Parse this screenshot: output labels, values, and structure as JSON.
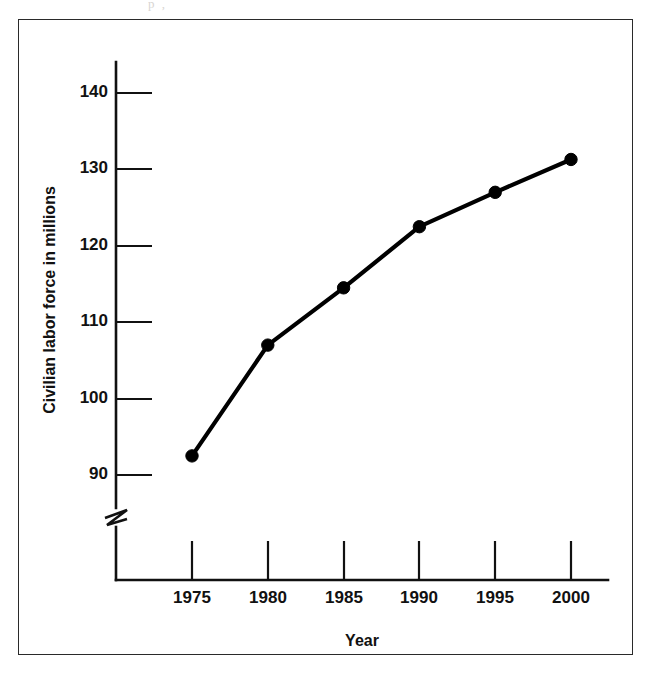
{
  "figure": {
    "scan_artifact_text": "p  ,",
    "frame_color": "#2a2a2a",
    "background": "#ffffff",
    "ink_color": "#000000"
  },
  "chart_data": {
    "type": "line",
    "title": "",
    "xlabel": "Year",
    "ylabel": "Civilian labor force in millions",
    "categories": [
      1975,
      1980,
      1985,
      1990,
      1995,
      2000
    ],
    "x": [
      1975,
      1980,
      1985,
      1990,
      1995,
      2000
    ],
    "values": [
      92.5,
      107.0,
      114.5,
      122.5,
      127.0,
      131.3
    ],
    "series": [
      {
        "name": "Civilian labor force",
        "values": [
          92.5,
          107.0,
          114.5,
          122.5,
          127.0,
          131.3
        ]
      }
    ],
    "xtick_labels": [
      "1975",
      "1980",
      "1985",
      "1990",
      "1995",
      "2000"
    ],
    "ytick_labels": [
      "90",
      "100",
      "110",
      "120",
      "130",
      "140"
    ],
    "yticks": [
      90,
      100,
      110,
      120,
      130,
      140
    ],
    "ylim": [
      90,
      145
    ],
    "xlim": [
      1972.5,
      2002.5
    ],
    "grid": false,
    "legend": "none",
    "y_axis_break": true,
    "marker": "filled-circle",
    "line_color": "#000000"
  }
}
